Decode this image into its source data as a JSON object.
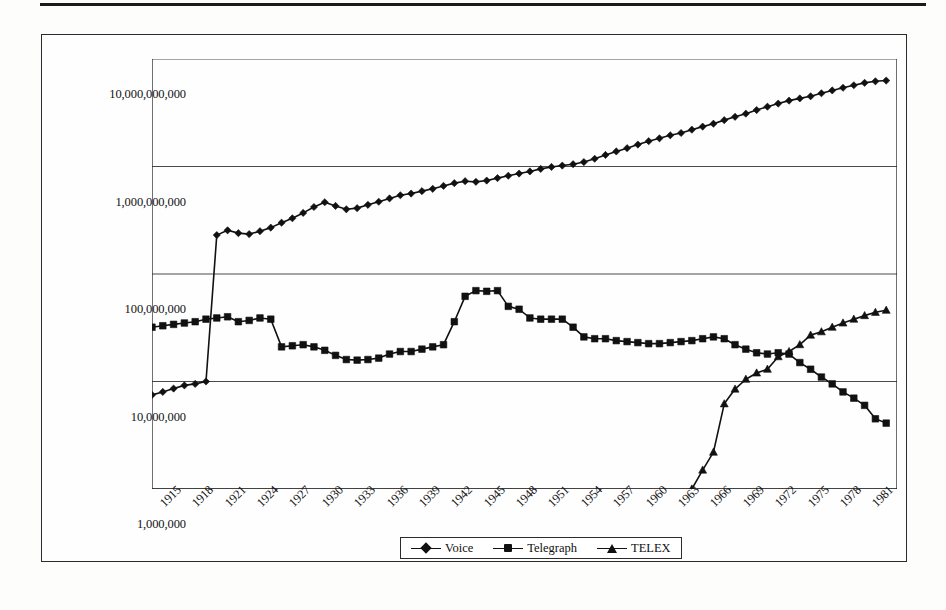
{
  "chart_data": {
    "type": "line",
    "title": "",
    "subtitle": "",
    "xlabel": "",
    "ylabel": "",
    "yscale": "log",
    "ylim": [
      1000000,
      10000000000
    ],
    "xlim": [
      1914,
      1983
    ],
    "grid": "horizontal",
    "legend_position": "bottom-center",
    "y_tick_labels": [
      "10,000,000,000",
      "1,000,000,000",
      "100,000,000",
      "10,000,000",
      "1,000,000"
    ],
    "y_tick_values": [
      10000000000,
      1000000000,
      100000000,
      10000000,
      1000000
    ],
    "x_tick_labels": [
      "1915",
      "1918",
      "1921",
      "1924",
      "1927",
      "1930",
      "1933",
      "1936",
      "1939",
      "1942",
      "1945",
      "1948",
      "1951",
      "1954",
      "1957",
      "1960",
      "1963",
      "1966",
      "1969",
      "1972",
      "1975",
      "1978",
      "1981"
    ],
    "x_tick_values": [
      1915,
      1918,
      1921,
      1924,
      1927,
      1930,
      1933,
      1936,
      1939,
      1942,
      1945,
      1948,
      1951,
      1954,
      1957,
      1960,
      1963,
      1966,
      1969,
      1972,
      1975,
      1978,
      1981
    ],
    "x_minor_tick_step": 1,
    "series": [
      {
        "name": "Voice",
        "marker": "diamond",
        "color": "#111111",
        "x": [
          1914,
          1915,
          1916,
          1917,
          1918,
          1919,
          1920,
          1921,
          1922,
          1923,
          1924,
          1925,
          1926,
          1927,
          1928,
          1929,
          1930,
          1931,
          1932,
          1933,
          1934,
          1935,
          1936,
          1937,
          1938,
          1939,
          1940,
          1941,
          1942,
          1943,
          1944,
          1945,
          1946,
          1947,
          1948,
          1949,
          1950,
          1951,
          1952,
          1953,
          1954,
          1955,
          1956,
          1957,
          1958,
          1959,
          1960,
          1961,
          1962,
          1963,
          1964,
          1965,
          1966,
          1967,
          1968,
          1969,
          1970,
          1971,
          1972,
          1973,
          1974,
          1975,
          1976,
          1977,
          1978,
          1979,
          1980,
          1981,
          1982
        ],
        "y": [
          7500000,
          8000000,
          8600000,
          9200000,
          9500000,
          10000000,
          230000000,
          255000000,
          240000000,
          235000000,
          250000000,
          270000000,
          300000000,
          330000000,
          370000000,
          420000000,
          465000000,
          430000000,
          400000000,
          410000000,
          440000000,
          470000000,
          505000000,
          540000000,
          560000000,
          590000000,
          620000000,
          660000000,
          700000000,
          730000000,
          720000000,
          740000000,
          780000000,
          820000000,
          860000000,
          900000000,
          950000000,
          990000000,
          1020000000,
          1050000000,
          1100000000,
          1180000000,
          1280000000,
          1380000000,
          1480000000,
          1600000000,
          1720000000,
          1830000000,
          1950000000,
          2050000000,
          2200000000,
          2350000000,
          2500000000,
          2700000000,
          2900000000,
          3100000000,
          3350000000,
          3600000000,
          3850000000,
          4100000000,
          4300000000,
          4500000000,
          4800000000,
          5100000000,
          5400000000,
          5700000000,
          6000000000,
          6200000000,
          6300000000
        ]
      },
      {
        "name": "Telegraph",
        "marker": "square",
        "color": "#111111",
        "x": [
          1914,
          1915,
          1916,
          1917,
          1918,
          1919,
          1920,
          1921,
          1922,
          1923,
          1924,
          1925,
          1926,
          1927,
          1928,
          1929,
          1930,
          1931,
          1932,
          1933,
          1934,
          1935,
          1936,
          1937,
          1938,
          1939,
          1940,
          1941,
          1942,
          1943,
          1944,
          1945,
          1946,
          1947,
          1948,
          1949,
          1950,
          1951,
          1952,
          1953,
          1954,
          1955,
          1956,
          1957,
          1958,
          1959,
          1960,
          1961,
          1962,
          1963,
          1964,
          1965,
          1966,
          1967,
          1968,
          1969,
          1970,
          1971,
          1972,
          1973,
          1974,
          1975,
          1976,
          1977,
          1978,
          1979,
          1980,
          1981,
          1982
        ],
        "y": [
          32000000,
          33000000,
          34000000,
          35000000,
          36000000,
          38000000,
          39000000,
          40000000,
          36000000,
          37000000,
          39000000,
          38000000,
          21000000,
          21500000,
          22000000,
          21000000,
          19500000,
          17500000,
          16000000,
          15800000,
          16000000,
          16500000,
          18000000,
          19000000,
          19000000,
          20000000,
          21000000,
          22000000,
          36000000,
          62000000,
          70000000,
          69000000,
          70000000,
          50000000,
          47000000,
          39000000,
          38000000,
          38000000,
          38000000,
          32000000,
          26000000,
          25000000,
          25000000,
          24000000,
          23500000,
          23000000,
          22500000,
          22500000,
          23000000,
          23500000,
          24000000,
          25000000,
          26000000,
          25000000,
          22000000,
          20000000,
          18500000,
          18000000,
          18500000,
          18000000,
          15000000,
          13000000,
          11000000,
          9500000,
          8000000,
          7000000,
          6000000,
          4500000,
          4100000
        ]
      },
      {
        "name": "TELEX",
        "marker": "triangle",
        "color": "#111111",
        "x": [
          1964,
          1965,
          1966,
          1967,
          1968,
          1969,
          1970,
          1971,
          1972,
          1973,
          1974,
          1975,
          1976,
          1977,
          1978,
          1979,
          1980,
          1981,
          1982
        ],
        "y": [
          1000000,
          1500000,
          2200000,
          6200000,
          8500000,
          10500000,
          12000000,
          13000000,
          17000000,
          19000000,
          22000000,
          27000000,
          29000000,
          32000000,
          35000000,
          38000000,
          41000000,
          44000000,
          46000000
        ]
      }
    ]
  }
}
